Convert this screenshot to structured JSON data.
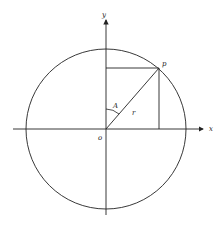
{
  "diagram": {
    "type": "unit-circle-angle",
    "labels": {
      "y_axis": "y",
      "x_axis": "x",
      "origin": "o",
      "point": "p",
      "angle": "A",
      "radius": "r"
    },
    "colors": {
      "stroke": "#222222",
      "background": "#ffffff"
    }
  }
}
